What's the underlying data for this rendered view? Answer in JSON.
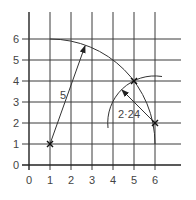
{
  "diagram": {
    "x_ticks": [
      "0",
      "1",
      "2",
      "3",
      "4",
      "5",
      "6"
    ],
    "y_ticks": [
      "0",
      "1",
      "2",
      "3",
      "4",
      "5",
      "6"
    ],
    "vector_labels": {
      "radius_large": "5",
      "radius_small": "2·24"
    },
    "points": [
      {
        "name": "start",
        "x": 1,
        "y": 1
      },
      {
        "name": "intersection",
        "x": 5,
        "y": 4
      },
      {
        "name": "end",
        "x": 6,
        "y": 2
      }
    ],
    "arcs": [
      {
        "center": [
          1,
          1
        ],
        "radius": 5
      },
      {
        "center": [
          6,
          2
        ],
        "radius": 2.24
      }
    ],
    "colors": {
      "line": "#333333",
      "background": "#ffffff"
    }
  }
}
